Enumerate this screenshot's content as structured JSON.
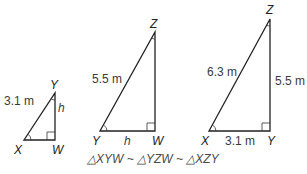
{
  "colors": {
    "stroke": "#222222",
    "label": "#3a3a3a",
    "caption": "#4a4a4a",
    "background": "#ffffff"
  },
  "triangles": [
    {
      "name": "XYW",
      "vertices": {
        "X": "X",
        "Y": "Y",
        "W": "W"
      },
      "labels": {
        "hypotenuse": "3.1 m",
        "leg": "h"
      },
      "right_angle_at": "W"
    },
    {
      "name": "YZW",
      "vertices": {
        "Y": "Y",
        "Z": "Z",
        "W": "W"
      },
      "labels": {
        "hypotenuse": "5.5 m",
        "base": "h"
      },
      "right_angle_at": "W"
    },
    {
      "name": "XZY",
      "vertices": {
        "X": "X",
        "Z": "Z",
        "Y": "Y"
      },
      "labels": {
        "hypotenuse": "6.3 m",
        "vertical": "5.5 m",
        "base": "3.1 m"
      },
      "right_angle_at": "Y"
    }
  ],
  "caption": "△XYW ~ △YZW ~ △XZY"
}
